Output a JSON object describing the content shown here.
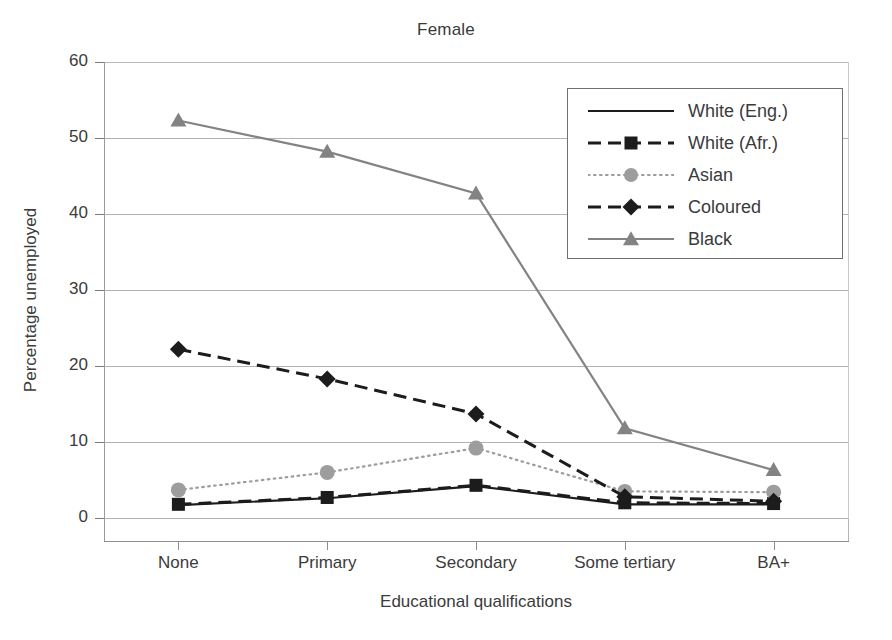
{
  "chart_data": {
    "type": "line",
    "title": "Female",
    "xlabel": "Educational qualifications",
    "ylabel": "Percentage unemployed",
    "categories": [
      "None",
      "Primary",
      "Secondary",
      "Some tertiary",
      "BA+"
    ],
    "ylim": [
      0,
      60
    ],
    "yticks": [
      0,
      10,
      20,
      30,
      40,
      50,
      60
    ],
    "grid": true,
    "legend_position": "upper right inside plot",
    "series": [
      {
        "name": "White (Eng.)",
        "values": [
          1.7,
          2.6,
          4.2,
          1.8,
          1.8
        ],
        "color": "#1c1c1c",
        "line_style": "solid",
        "marker": "none"
      },
      {
        "name": "White (Afr.)",
        "values": [
          1.8,
          2.7,
          4.3,
          2.0,
          1.9
        ],
        "color": "#1c1c1c",
        "line_style": "dashed",
        "marker": "square"
      },
      {
        "name": "Asian",
        "values": [
          3.7,
          6.0,
          9.2,
          3.5,
          3.4
        ],
        "color": "#9d9d9d",
        "line_style": "dotted",
        "marker": "circle"
      },
      {
        "name": "Coloured",
        "values": [
          22.2,
          18.3,
          13.7,
          2.8,
          2.2
        ],
        "color": "#1c1c1c",
        "line_style": "dashed",
        "marker": "diamond"
      },
      {
        "name": "Black",
        "values": [
          52.3,
          48.2,
          42.7,
          11.8,
          6.3
        ],
        "color": "#838383",
        "line_style": "solid",
        "marker": "triangle"
      }
    ]
  }
}
